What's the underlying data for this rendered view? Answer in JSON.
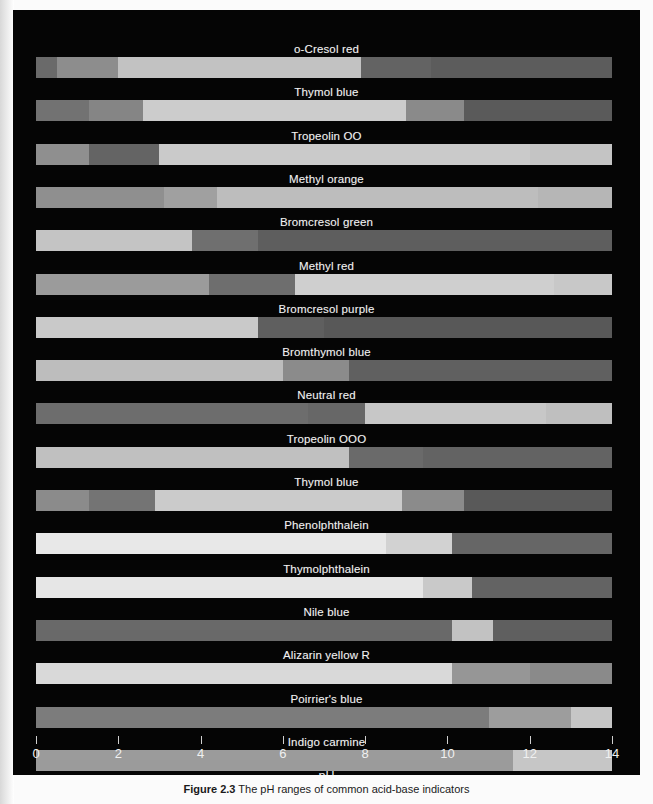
{
  "figure": {
    "background_color": "#050505",
    "label_color": "#f2f2f2",
    "axis": {
      "title": "pH",
      "min": 0,
      "max": 14,
      "tick_step": 2,
      "tick_labels": [
        "0",
        "2",
        "4",
        "6",
        "8",
        "10",
        "12",
        "14"
      ],
      "tick_color": "#cfcfcf"
    },
    "caption": {
      "prefix": "Figure 2.3",
      "text": "The pH ranges of common acid-base indicators"
    }
  },
  "chart_data": {
    "type": "bar",
    "xlabel": "pH",
    "ylabel": "",
    "xlim": [
      0,
      14
    ],
    "grid": false,
    "legend": "none",
    "note": "Horizontal colour-range bars; image is reproduced in greyscale. Each indicator bar spans a pH sub-range with colour segments; transition pH values read from the axis.",
    "categories": [
      "o-Cresol red",
      "Thymol blue",
      "Tropeolin OO",
      "Methyl orange",
      "Bromcresol green",
      "Methyl red",
      "Bromcresol purple",
      "Bromthymol blue",
      "Neutral red",
      "Tropeolin OOO",
      "Thymol blue",
      "Phenolphthalein",
      "Thymolphthalein",
      "Nile blue",
      "Alizarin yellow R",
      "Indigo carmine"
    ],
    "series": [
      {
        "name": "o-Cresol red",
        "label": "o-Cresol red",
        "bar_start_ph": 0.0,
        "bar_end_ph": 14.0,
        "segments": [
          {
            "from_ph": 0.0,
            "to_ph": 0.5,
            "color": "#6a6a6a"
          },
          {
            "from_ph": 0.5,
            "to_ph": 2.0,
            "color": "#8d8d8d"
          },
          {
            "from_ph": 2.0,
            "to_ph": 7.9,
            "color": "#c2c2c2"
          },
          {
            "from_ph": 7.9,
            "to_ph": 9.6,
            "color": "#636363"
          },
          {
            "from_ph": 9.6,
            "to_ph": 14.0,
            "color": "#5c5c5c"
          }
        ]
      },
      {
        "name": "Thymol blue",
        "label": "Thymol blue",
        "bar_start_ph": 0.0,
        "bar_end_ph": 14.0,
        "segments": [
          {
            "from_ph": 0.0,
            "to_ph": 1.3,
            "color": "#727272"
          },
          {
            "from_ph": 1.3,
            "to_ph": 2.6,
            "color": "#858585"
          },
          {
            "from_ph": 2.6,
            "to_ph": 9.0,
            "color": "#cccccc"
          },
          {
            "from_ph": 9.0,
            "to_ph": 10.4,
            "color": "#8a8a8a"
          },
          {
            "from_ph": 10.4,
            "to_ph": 14.0,
            "color": "#5a5a5a"
          }
        ]
      },
      {
        "name": "Tropeolin OO",
        "label": "Tropeolin OO",
        "bar_start_ph": 0.0,
        "bar_end_ph": 14.0,
        "segments": [
          {
            "from_ph": 0.0,
            "to_ph": 1.3,
            "color": "#8f8f8f"
          },
          {
            "from_ph": 1.3,
            "to_ph": 3.0,
            "color": "#646464"
          },
          {
            "from_ph": 3.0,
            "to_ph": 12.0,
            "color": "#cacaca"
          },
          {
            "from_ph": 12.0,
            "to_ph": 14.0,
            "color": "#c4c4c4"
          }
        ]
      },
      {
        "name": "Methyl orange",
        "label": "Methyl orange",
        "bar_start_ph": 0.0,
        "bar_end_ph": 14.0,
        "segments": [
          {
            "from_ph": 0.0,
            "to_ph": 3.1,
            "color": "#8f8f8f"
          },
          {
            "from_ph": 3.1,
            "to_ph": 4.4,
            "color": "#a0a0a0"
          },
          {
            "from_ph": 4.4,
            "to_ph": 12.2,
            "color": "#bdbdbd"
          },
          {
            "from_ph": 12.2,
            "to_ph": 14.0,
            "color": "#b6b6b6"
          }
        ]
      },
      {
        "name": "Bromcresol green",
        "label": "Bromcresol green",
        "bar_start_ph": 0.0,
        "bar_end_ph": 14.0,
        "segments": [
          {
            "from_ph": 0.0,
            "to_ph": 3.8,
            "color": "#c4c4c4"
          },
          {
            "from_ph": 3.8,
            "to_ph": 5.4,
            "color": "#6f6f6f"
          },
          {
            "from_ph": 5.4,
            "to_ph": 14.0,
            "color": "#5e5e5e"
          }
        ]
      },
      {
        "name": "Methyl red",
        "label": "Methyl red",
        "bar_start_ph": 0.0,
        "bar_end_ph": 14.0,
        "segments": [
          {
            "from_ph": 0.0,
            "to_ph": 4.2,
            "color": "#9b9b9b"
          },
          {
            "from_ph": 4.2,
            "to_ph": 6.3,
            "color": "#6e6e6e"
          },
          {
            "from_ph": 6.3,
            "to_ph": 12.6,
            "color": "#cfcfcf"
          },
          {
            "from_ph": 12.6,
            "to_ph": 14.0,
            "color": "#c8c8c8"
          }
        ]
      },
      {
        "name": "Bromcresol purple",
        "label": "Bromcresol purple",
        "bar_start_ph": 0.0,
        "bar_end_ph": 14.0,
        "segments": [
          {
            "from_ph": 0.0,
            "to_ph": 5.4,
            "color": "#c9c9c9"
          },
          {
            "from_ph": 5.4,
            "to_ph": 7.0,
            "color": "#5f5f5f"
          },
          {
            "from_ph": 7.0,
            "to_ph": 14.0,
            "color": "#585858"
          }
        ]
      },
      {
        "name": "Bromthymol blue",
        "label": "Bromthymol blue",
        "bar_start_ph": 0.0,
        "bar_end_ph": 14.0,
        "segments": [
          {
            "from_ph": 0.0,
            "to_ph": 6.0,
            "color": "#bdbdbd"
          },
          {
            "from_ph": 6.0,
            "to_ph": 7.6,
            "color": "#8b8b8b"
          },
          {
            "from_ph": 7.6,
            "to_ph": 14.0,
            "color": "#606060"
          }
        ]
      },
      {
        "name": "Neutral red",
        "label": "Neutral red",
        "bar_start_ph": 0.0,
        "bar_end_ph": 14.0,
        "segments": [
          {
            "from_ph": 0.0,
            "to_ph": 6.6,
            "color": "#6d6d6d"
          },
          {
            "from_ph": 6.6,
            "to_ph": 8.0,
            "color": "#676767"
          },
          {
            "from_ph": 8.0,
            "to_ph": 12.4,
            "color": "#c7c7c7"
          },
          {
            "from_ph": 12.4,
            "to_ph": 14.0,
            "color": "#bfbfbf"
          }
        ]
      },
      {
        "name": "Tropeolin OOO",
        "label": "Tropeolin OOO",
        "bar_start_ph": 0.0,
        "bar_end_ph": 14.0,
        "segments": [
          {
            "from_ph": 0.0,
            "to_ph": 7.6,
            "color": "#c0c0c0"
          },
          {
            "from_ph": 7.6,
            "to_ph": 9.4,
            "color": "#6a6a6a"
          },
          {
            "from_ph": 9.4,
            "to_ph": 14.0,
            "color": "#636363"
          }
        ]
      },
      {
        "name": "Thymol blue",
        "label": "Thymol blue",
        "bar_start_ph": 0.0,
        "bar_end_ph": 14.0,
        "segments": [
          {
            "from_ph": 0.0,
            "to_ph": 1.3,
            "color": "#8b8b8b"
          },
          {
            "from_ph": 1.3,
            "to_ph": 2.9,
            "color": "#747474"
          },
          {
            "from_ph": 2.9,
            "to_ph": 8.9,
            "color": "#cbcbcb"
          },
          {
            "from_ph": 8.9,
            "to_ph": 10.4,
            "color": "#8b8b8b"
          },
          {
            "from_ph": 10.4,
            "to_ph": 14.0,
            "color": "#595959"
          }
        ]
      },
      {
        "name": "Phenolphthalein",
        "label": "Phenolphthalein",
        "bar_start_ph": 0.0,
        "bar_end_ph": 14.0,
        "segments": [
          {
            "from_ph": 0.0,
            "to_ph": 8.5,
            "color": "#e8e8e8"
          },
          {
            "from_ph": 8.5,
            "to_ph": 10.1,
            "color": "#d2d2d2"
          },
          {
            "from_ph": 10.1,
            "to_ph": 14.0,
            "color": "#666666"
          }
        ]
      },
      {
        "name": "Thymolphthalein",
        "label": "Thymolphthalein",
        "bar_start_ph": 0.0,
        "bar_end_ph": 14.0,
        "segments": [
          {
            "from_ph": 0.0,
            "to_ph": 9.4,
            "color": "#e6e6e6"
          },
          {
            "from_ph": 9.4,
            "to_ph": 10.6,
            "color": "#c9c9c9"
          },
          {
            "from_ph": 10.6,
            "to_ph": 14.0,
            "color": "#636363"
          }
        ]
      },
      {
        "name": "Nile blue",
        "label": "Nile blue",
        "bar_start_ph": 0.0,
        "bar_end_ph": 14.0,
        "segments": [
          {
            "from_ph": 0.0,
            "to_ph": 10.1,
            "color": "#696969"
          },
          {
            "from_ph": 10.1,
            "to_ph": 11.1,
            "color": "#c2c2c2"
          },
          {
            "from_ph": 11.1,
            "to_ph": 14.0,
            "color": "#5f5f5f"
          }
        ]
      },
      {
        "name": "Alizarin yellow R",
        "label": "Alizarin yellow R",
        "bar_start_ph": 0.0,
        "bar_end_ph": 14.0,
        "segments": [
          {
            "from_ph": 0.0,
            "to_ph": 10.1,
            "color": "#d9d9d9"
          },
          {
            "from_ph": 10.1,
            "to_ph": 12.0,
            "color": "#969696"
          },
          {
            "from_ph": 12.0,
            "to_ph": 14.0,
            "color": "#8a8a8a"
          }
        ]
      },
      {
        "name": "Poirrier's blue",
        "label": "Poirrier's blue",
        "bar_start_ph": 0.0,
        "bar_end_ph": 14.0,
        "segments": [
          {
            "from_ph": 0.0,
            "to_ph": 11.0,
            "color": "#7c7c7c"
          },
          {
            "from_ph": 11.0,
            "to_ph": 13.0,
            "color": "#9d9d9d"
          },
          {
            "from_ph": 13.0,
            "to_ph": 14.0,
            "color": "#c6c6c6"
          }
        ]
      },
      {
        "name": "Indigo carmine",
        "label": "Indigo carmine",
        "bar_start_ph": 0.0,
        "bar_end_ph": 14.0,
        "segments": [
          {
            "from_ph": 0.0,
            "to_ph": 11.6,
            "color": "#9b9b9b"
          },
          {
            "from_ph": 11.6,
            "to_ph": 14.0,
            "color": "#c6c6c6"
          }
        ]
      }
    ]
  }
}
